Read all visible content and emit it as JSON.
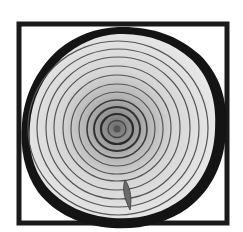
{
  "image": {
    "subject": "tree-trunk-cross-section",
    "colors": {
      "background": "#ffffff",
      "frame": "#1a1a1a",
      "bark": "#141414",
      "wood_light": "#e4e4e4",
      "wood_mid": "#c8c8c8",
      "heart": "#8a8a8a",
      "ring_line": "#555555"
    }
  }
}
